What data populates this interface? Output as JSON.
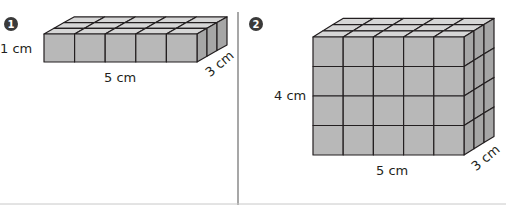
{
  "problems": [
    {
      "number": "1",
      "figure": "rectangular-prism-of-unit-cubes",
      "cubes": {
        "length": 5,
        "width": 3,
        "height": 1
      },
      "labels": {
        "height": "1 cm",
        "length": "5 cm",
        "width": "3 cm"
      }
    },
    {
      "number": "2",
      "figure": "rectangular-prism-of-unit-cubes",
      "cubes": {
        "length": 5,
        "width": 3,
        "height": 4
      },
      "labels": {
        "height": "4 cm",
        "length": "5 cm",
        "width": "3 cm"
      }
    }
  ],
  "colors": {
    "cube_front": "#b8b8b8",
    "cube_top": "#d6d6d6",
    "cube_side": "#a6a6a6",
    "edge": "#231f20",
    "divider": "#8a8a8a",
    "badge": "#3a3a3a"
  }
}
